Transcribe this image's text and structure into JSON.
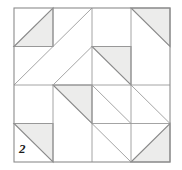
{
  "figure": {
    "kind": "quilt-block-diagram",
    "label": "2",
    "label_position": {
      "x": 19,
      "y": 142
    },
    "canvas": {
      "width": 182,
      "height": 170
    },
    "background_color": "#ffffff"
  },
  "grid": {
    "origin": {
      "x": 14,
      "y": 8
    },
    "size": {
      "width": 156,
      "height": 154
    },
    "rows": 4,
    "cols": 4,
    "cell": {
      "width": 39,
      "height": 38.5
    },
    "outer_border_color": "#8c8c8c",
    "outer_border_width": 1.1,
    "inner_line_color": "#9a9a9a",
    "inner_line_width": 0.9
  },
  "style": {
    "triangle_fill": "#ececeb",
    "triangle_stroke": "#8a8a8a",
    "triangle_stroke_width": 1.1,
    "diagonal_line_color": "#a6a6a6",
    "diagonal_line_width": 1.0
  },
  "cells": [
    {
      "row": 0,
      "col": 0,
      "name": "cell-r0-c0",
      "filled": true,
      "fill_half": "lower-right",
      "diagonal": "anti"
    },
    {
      "row": 0,
      "col": 1,
      "name": "cell-r0-c1",
      "filled": false,
      "fill_half": null,
      "diagonal": "anti"
    },
    {
      "row": 0,
      "col": 2,
      "name": "cell-r0-c2",
      "filled": false,
      "fill_half": null,
      "diagonal": null
    },
    {
      "row": 0,
      "col": 3,
      "name": "cell-r0-c3",
      "filled": true,
      "fill_half": "upper-left",
      "diagonal": "main"
    },
    {
      "row": 1,
      "col": 0,
      "name": "cell-r1-c0",
      "filled": false,
      "fill_half": null,
      "diagonal": "anti"
    },
    {
      "row": 1,
      "col": 1,
      "name": "cell-r1-c1",
      "filled": false,
      "fill_half": null,
      "diagonal": "anti"
    },
    {
      "row": 1,
      "col": 2,
      "name": "cell-r1-c2",
      "filled": true,
      "fill_half": "upper-left",
      "diagonal": "main"
    },
    {
      "row": 1,
      "col": 3,
      "name": "cell-r1-c3",
      "filled": false,
      "fill_half": null,
      "diagonal": null
    },
    {
      "row": 2,
      "col": 0,
      "name": "cell-r2-c0",
      "filled": false,
      "fill_half": null,
      "diagonal": null
    },
    {
      "row": 2,
      "col": 1,
      "name": "cell-r2-c1",
      "filled": true,
      "fill_half": "upper-left",
      "diagonal": "main"
    },
    {
      "row": 2,
      "col": 2,
      "name": "cell-r2-c2",
      "filled": false,
      "fill_half": null,
      "diagonal": "main"
    },
    {
      "row": 2,
      "col": 3,
      "name": "cell-r2-c3",
      "filled": false,
      "fill_half": null,
      "diagonal": "main"
    },
    {
      "row": 3,
      "col": 0,
      "name": "cell-r3-c0",
      "filled": true,
      "fill_half": "upper-left",
      "diagonal": "main"
    },
    {
      "row": 3,
      "col": 1,
      "name": "cell-r3-c1",
      "filled": false,
      "fill_half": null,
      "diagonal": null
    },
    {
      "row": 3,
      "col": 2,
      "name": "cell-r3-c2",
      "filled": false,
      "fill_half": null,
      "diagonal": "main"
    },
    {
      "row": 3,
      "col": 3,
      "name": "cell-r3-c3",
      "filled": true,
      "fill_half": "lower-right",
      "diagonal": "main"
    }
  ],
  "inner_gridlines": {
    "horizontal_rows": [
      1,
      2,
      3
    ],
    "vertical_cols": [
      1,
      2,
      3
    ],
    "horizontal_segments": [
      {
        "row": 1,
        "from_col": 0,
        "to_col": 1
      },
      {
        "row": 1,
        "from_col": 2,
        "to_col": 3
      },
      {
        "row": 2,
        "from_col": 0,
        "to_col": 4
      },
      {
        "row": 3,
        "from_col": 0,
        "to_col": 1
      },
      {
        "row": 3,
        "from_col": 2,
        "to_col": 4
      }
    ],
    "vertical_segments": [
      {
        "col": 1,
        "from_row": 0,
        "to_row": 1
      },
      {
        "col": 1,
        "from_row": 2,
        "to_row": 4
      },
      {
        "col": 2,
        "from_row": 0,
        "to_row": 2
      },
      {
        "col": 2,
        "from_row": 2,
        "to_row": 4
      },
      {
        "col": 3,
        "from_row": 0,
        "to_row": 2
      },
      {
        "col": 3,
        "from_row": 2,
        "to_row": 4
      }
    ]
  }
}
